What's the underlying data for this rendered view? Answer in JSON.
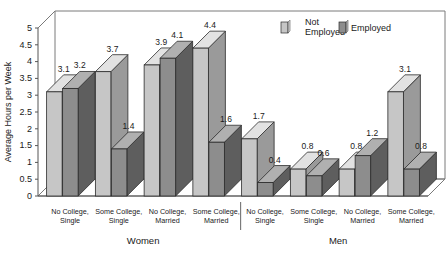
{
  "chart_data": {
    "type": "bar",
    "title": "",
    "subtitle": "",
    "xlabel": "",
    "ylabel": "Average Hours per Week",
    "ylim": [
      0,
      5
    ],
    "ytick_step": 0.5,
    "ytick_labels": [
      "0",
      "0.5",
      "1",
      "1.5",
      "2",
      "2.5",
      "3",
      "3.5",
      "4",
      "4.5",
      "5"
    ],
    "grid": false,
    "legend_position": "top-right",
    "three_d": true,
    "panel_labels": [
      "Women",
      "Men"
    ],
    "categories": [
      "No College, Single",
      "Some College, Single",
      "No College, Married",
      "Some College, Married",
      "No College, Single",
      "Some College, Single",
      "No College, Married",
      "Some College, Married"
    ],
    "category_lines": [
      [
        "No College,",
        "Single"
      ],
      [
        "Some College,",
        "Single"
      ],
      [
        "No College,",
        "Married"
      ],
      [
        "Some College,",
        "Married"
      ],
      [
        "No College,",
        "Single"
      ],
      [
        "Some College,",
        "Single"
      ],
      [
        "No College,",
        "Married"
      ],
      [
        "Some College,",
        "Married"
      ]
    ],
    "series": [
      {
        "name": "Not Employed",
        "color": "#c6c6c6",
        "top_color": "#e2e2e2",
        "side_color": "#9a9a9a",
        "values": [
          3.1,
          3.7,
          3.9,
          4.4,
          1.7,
          0.8,
          0.8,
          3.1
        ]
      },
      {
        "name": "Employed",
        "color": "#8d8d8d",
        "top_color": "#b0b0b0",
        "side_color": "#5e5e5e",
        "values": [
          3.2,
          1.4,
          4.1,
          1.6,
          0.4,
          0.6,
          1.2,
          0.8
        ]
      }
    ],
    "value_labels": {
      "Not Employed": [
        "3.1",
        "3.7",
        "3.9",
        "4.4",
        "1.7",
        "0.8",
        "0.8",
        "3.1"
      ],
      "Employed": [
        "3.2",
        "1.4",
        "4.1",
        "1.6",
        "0.4",
        "0.6",
        "1.2",
        "0.8"
      ]
    }
  },
  "legend": {
    "items": [
      {
        "label_line1": "Not",
        "label_line2": "Employed",
        "label": "Not Employed",
        "color": "#c6c6c6"
      },
      {
        "label_line1": "Employed",
        "label_line2": "",
        "label": "Employed",
        "color": "#8d8d8d"
      }
    ]
  },
  "axis": {
    "y_title": "Average Hours per Week"
  },
  "groups": [
    {
      "label": "Women"
    },
    {
      "label": "Men"
    }
  ],
  "colors": {
    "background": "#ffffff",
    "axis": "#555555",
    "wall": "#7a7a7a",
    "text": "#1a1a1a",
    "not_employed": "#c6c6c6",
    "employed": "#8d8d8d"
  }
}
